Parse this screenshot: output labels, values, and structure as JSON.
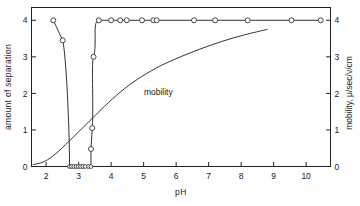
{
  "chart_data": {
    "type": "line",
    "title": "",
    "xlabel": "pH",
    "ylabel": "amount of separation",
    "y2label": "mobility, μ/sec/v/cm",
    "xlim": [
      1.55,
      10.75
    ],
    "ylim": [
      0,
      4.35
    ],
    "y2lim": [
      0,
      4.35
    ],
    "grid": false,
    "legend": "none",
    "xticks": [
      2,
      3,
      4,
      5,
      6,
      7,
      8,
      9,
      10
    ],
    "xticklabels": [
      "2",
      "3",
      "4",
      "5",
      "6",
      "7",
      "8",
      "9",
      "10"
    ],
    "yticks": [
      0,
      1,
      2,
      3,
      4
    ],
    "yticklabels": [
      "0",
      "1",
      "2",
      "3",
      "4"
    ],
    "y2ticks": [
      0,
      1,
      2,
      3,
      4
    ],
    "y2ticklabels": [
      "0",
      "1",
      "2",
      "3",
      "4"
    ],
    "series": [
      {
        "name": "amount of separation",
        "axis": "left",
        "marker": "open-circle",
        "x": [
          2.22,
          2.51,
          2.72,
          2.78,
          2.85,
          2.92,
          2.99,
          3.06,
          3.13,
          3.2,
          3.3,
          3.38,
          3.38,
          3.42,
          3.46,
          3.62,
          4.0,
          4.28,
          4.48,
          4.95,
          5.3,
          5.4,
          6.55,
          7.2,
          8.2,
          9.55,
          10.45
        ],
        "y": [
          4.0,
          3.45,
          0.0,
          0.0,
          0.0,
          0.0,
          0.0,
          0.0,
          0.0,
          0.0,
          0.0,
          0.0,
          0.48,
          1.05,
          3.0,
          4.0,
          4.0,
          4.0,
          4.0,
          4.0,
          4.0,
          4.0,
          4.0,
          4.0,
          4.0,
          4.0,
          4.0
        ]
      },
      {
        "name": "mobility",
        "axis": "right",
        "marker": "none",
        "x": [
          1.6,
          1.9,
          2.2,
          2.6,
          3.0,
          3.4,
          3.8,
          4.3,
          4.8,
          5.4,
          6.0,
          6.7,
          7.4,
          8.1,
          8.8
        ],
        "y": [
          0.05,
          0.12,
          0.28,
          0.6,
          0.95,
          1.3,
          1.65,
          2.05,
          2.38,
          2.7,
          2.95,
          3.2,
          3.42,
          3.6,
          3.75
        ]
      }
    ],
    "annotations": [
      {
        "text": "mobility",
        "x": 5.45,
        "y": 1.95
      }
    ]
  }
}
